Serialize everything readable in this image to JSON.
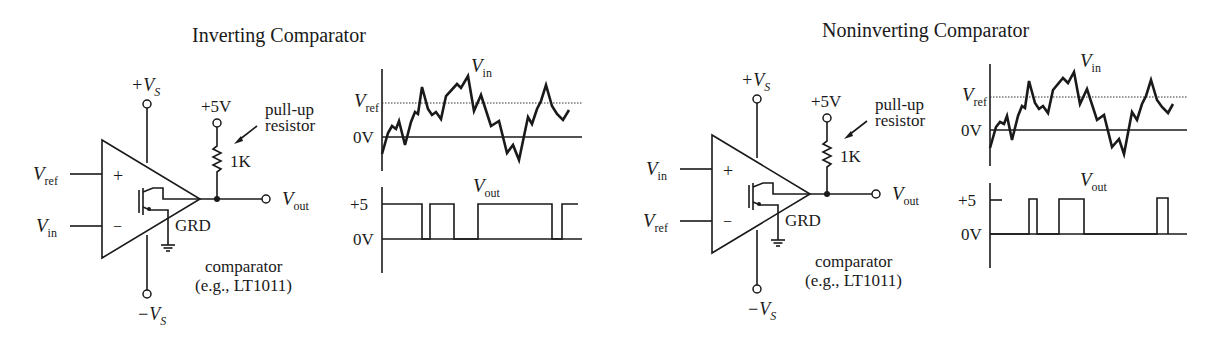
{
  "diagrams": [
    {
      "title": "Inverting Comparator",
      "supply_pos": {
        "base": "+V",
        "sub": "S"
      },
      "supply_neg": {
        "base": "−V",
        "sub": "S"
      },
      "pullup_supply": "+5V",
      "pullup_label_line1": "pull-up",
      "pullup_label_line2": "resistor",
      "resistor_value": "1K",
      "input_plus": {
        "base": "V",
        "sub": "ref",
        "sign": "+"
      },
      "input_minus": {
        "base": "V",
        "sub": "in",
        "sign": "−"
      },
      "output": {
        "base": "V",
        "sub": "out"
      },
      "ground_label": "GRD",
      "part_line1": "comparator",
      "part_line2": "(e.g., LT1011)"
    },
    {
      "title": "Noninverting Comparator",
      "supply_pos": {
        "base": "+V",
        "sub": "S"
      },
      "supply_neg": {
        "base": "−V",
        "sub": "S"
      },
      "pullup_supply": "+5V",
      "pullup_label_line1": "pull-up",
      "pullup_label_line2": "resistor",
      "resistor_value": "1K",
      "input_plus": {
        "base": "V",
        "sub": "in",
        "sign": "+"
      },
      "input_minus": {
        "base": "V",
        "sub": "ref",
        "sign": "−"
      },
      "output": {
        "base": "V",
        "sub": "out"
      },
      "ground_label": "GRD",
      "part_line1": "comparator",
      "part_line2": "(e.g., LT1011)"
    }
  ],
  "waveforms": [
    {
      "input_plot": {
        "signal_label": {
          "base": "V",
          "sub": "in"
        },
        "ref_label": {
          "base": "V",
          "sub": "ref"
        },
        "zero_label": "0V"
      },
      "output_plot": {
        "signal_label": {
          "base": "V",
          "sub": "out"
        },
        "high_label": "+5",
        "zero_label": "0V"
      }
    },
    {
      "input_plot": {
        "signal_label": {
          "base": "V",
          "sub": "in"
        },
        "ref_label": {
          "base": "V",
          "sub": "ref"
        },
        "zero_label": "0V"
      },
      "output_plot": {
        "signal_label": {
          "base": "V",
          "sub": "out"
        },
        "high_label": "+5",
        "zero_label": "0V"
      }
    }
  ]
}
